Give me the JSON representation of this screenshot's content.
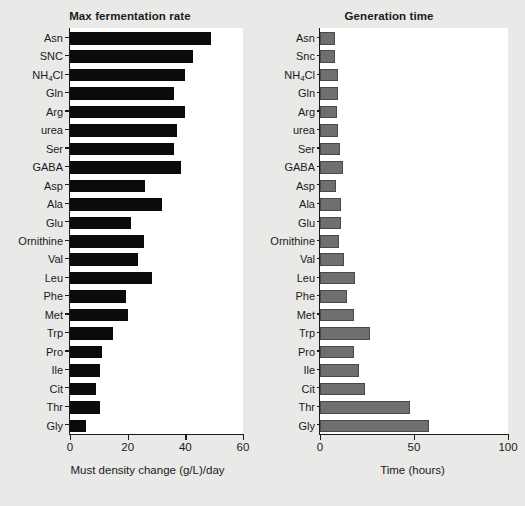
{
  "figure": {
    "background_color": "#e9e9e7",
    "plot_background_color": "#ffffff"
  },
  "chart_data": [
    {
      "type": "bar",
      "orientation": "horizontal",
      "title": "Max fermentation rate",
      "xlabel": "Must density change (g/L)/day",
      "ylabel": "",
      "xlim": [
        0,
        60
      ],
      "xticks": [
        0,
        20,
        40,
        60
      ],
      "xtick_labels": [
        "0",
        "20",
        "40",
        "60"
      ],
      "grid": false,
      "legend": "none",
      "bar_color": "#0b0b0b",
      "categories": [
        "Asn",
        "SNC",
        "NH4Cl",
        "Gln",
        "Arg",
        "urea",
        "Ser",
        "GABA",
        "Asp",
        "Ala",
        "Glu",
        "Ornithine",
        "Val",
        "Leu",
        "Phe",
        "Met",
        "Trp",
        "Pro",
        "Ile",
        "Cit",
        "Thr",
        "Gly"
      ],
      "category_labels_html": [
        "Asn",
        "SNC",
        "NH<sub>4</sub>Cl",
        "Gln",
        "Arg",
        "urea",
        "Ser",
        "GABA",
        "Asp",
        "Ala",
        "Glu",
        "Ornithine",
        "Val",
        "Leu",
        "Phe",
        "Met",
        "Trp",
        "Pro",
        "Ile",
        "Cit",
        "Thr",
        "Gly"
      ],
      "values": [
        49,
        42.5,
        40,
        36,
        40,
        37,
        36,
        38.5,
        26,
        32,
        21,
        25.5,
        23.5,
        28.5,
        19.5,
        20,
        15,
        11,
        10.5,
        9,
        10.5,
        5.5
      ]
    },
    {
      "type": "bar",
      "orientation": "horizontal",
      "title": "Generation time",
      "xlabel": "Time (hours)",
      "ylabel": "",
      "xlim": [
        0,
        100
      ],
      "xticks": [
        0,
        50,
        100
      ],
      "xtick_labels": [
        "0",
        "50",
        "100"
      ],
      "grid": false,
      "legend": "none",
      "bar_color": "#6f6f6f",
      "bar_edge_color": "#4a4a4a",
      "categories": [
        "Asn",
        "Snc",
        "NH4Cl",
        "Gln",
        "Arg",
        "urea",
        "Ser",
        "GABA",
        "Asp",
        "Ala",
        "Glu",
        "Ornithine",
        "Val",
        "Leu",
        "Phe",
        "Met",
        "Trp",
        "Pro",
        "Ile",
        "Cit",
        "Thr",
        "Gly"
      ],
      "category_labels_html": [
        "Asn",
        "Snc",
        "NH<sub>4</sub>Cl",
        "Gln",
        "Arg",
        "urea",
        "Ser",
        "GABA",
        "Asp",
        "Ala",
        "Glu",
        "Ornithine",
        "Val",
        "Leu",
        "Phe",
        "Met",
        "Trp",
        "Pro",
        "Ile",
        "Cit",
        "Thr",
        "Gly"
      ],
      "values": [
        8,
        8,
        9.5,
        9.5,
        9,
        9.5,
        10.5,
        12,
        8.5,
        11,
        11,
        10,
        13,
        18.5,
        14.5,
        18,
        26.5,
        18,
        21,
        24,
        48,
        58
      ]
    }
  ]
}
